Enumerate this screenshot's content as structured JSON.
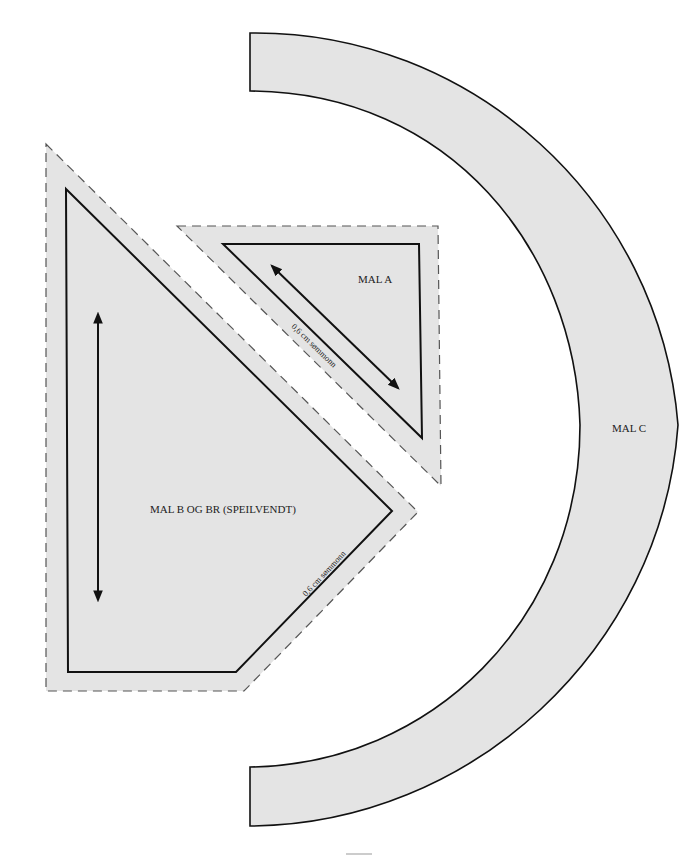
{
  "colors": {
    "fill": "#e4e4e4",
    "stroke": "#111111",
    "dash": "#555555",
    "background": "#ffffff"
  },
  "pieces": {
    "mal_a": {
      "label": "MAL A",
      "seam_label": "0,6 cm sømmonn"
    },
    "mal_b": {
      "label": "MAL B OG BR (SPEILVENDT)",
      "seam_label": "0,6 cm sømmonn"
    },
    "mal_c": {
      "label": "MAL C"
    }
  },
  "icons": {
    "grain_arrow_a": "double-arrow-diagonal",
    "grain_arrow_b": "double-arrow-vertical"
  }
}
